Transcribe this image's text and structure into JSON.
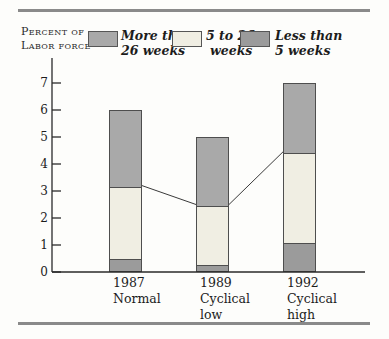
{
  "header": {
    "line1": "Percent of",
    "line2": "Labor force"
  },
  "legend": [
    {
      "label_line1": "More than",
      "label_line2": "26 weeks",
      "color": "#a9a9a9",
      "series": "More than 26 weeks"
    },
    {
      "label_line1": "5 to 26",
      "label_line2": "weeks",
      "color": "#f0eee3",
      "series": "5 to 26 weeks"
    },
    {
      "label_line1": "Less than",
      "label_line2": "5 weeks",
      "color": "#9b9b9b",
      "series": "Less than 5 weeks"
    }
  ],
  "chart_data": {
    "type": "bar",
    "stacked": true,
    "title": "",
    "ylabel": "Percent of labor force",
    "xlabel": "",
    "categories": [
      {
        "lines": [
          "1987",
          "Normal"
        ]
      },
      {
        "lines": [
          "1989",
          "Cyclical",
          "low"
        ]
      },
      {
        "lines": [
          "1992",
          "Cyclical",
          "high"
        ]
      }
    ],
    "series": [
      {
        "name": "Less than 5 weeks",
        "values": [
          0.5,
          0.3,
          1.1
        ],
        "color": "#9b9b9b"
      },
      {
        "name": "5 to 26 weeks",
        "values": [
          2.7,
          2.2,
          3.35
        ],
        "color": "#f0eee3"
      },
      {
        "name": "More than 26 weeks",
        "values": [
          2.8,
          2.5,
          2.55
        ],
        "color": "#a9a9a9"
      }
    ],
    "totals": [
      6.0,
      5.0,
      7.0
    ],
    "ylim": [
      0,
      7
    ],
    "yticks": [
      0,
      1,
      2,
      3,
      4,
      5,
      6,
      7
    ],
    "grid": false,
    "legend_position": "top",
    "connector_line": {
      "description": "line linking tops of the '5 to 26 weeks' segments between adjacent bars",
      "cumulative_values": [
        3.2,
        2.5,
        4.45
      ]
    }
  },
  "colors": {
    "rule": "#8a8a8a",
    "axis": "#2a2a2a",
    "bar_border": "#4e4e4e",
    "connector": "#3a3a3a",
    "text": "#1c1c1c"
  }
}
